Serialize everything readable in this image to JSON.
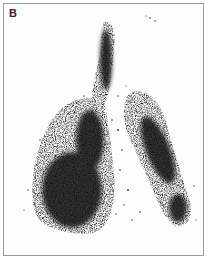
{
  "figure": {
    "panel_label": "B",
    "colors": {
      "background": "#fdfdfd",
      "border": "#9a9a9a",
      "tracer": "#111111"
    }
  }
}
